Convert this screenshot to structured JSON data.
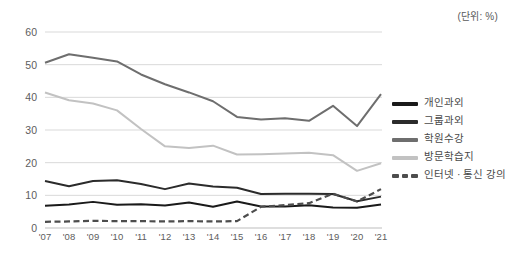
{
  "unit_note": "(단위: %)",
  "legend": {
    "position": "right",
    "items": [
      {
        "label": "개인과외",
        "color": "#1a1a1a",
        "style": "solid"
      },
      {
        "label": "그룹과외",
        "color": "#2b2b2b",
        "style": "solid"
      },
      {
        "label": "학원수강",
        "color": "#6e6e6e",
        "style": "solid"
      },
      {
        "label": "방문학습지",
        "color": "#c2c2c2",
        "style": "solid"
      },
      {
        "label": "인터넷 · 통신 강의",
        "color": "#4d4d4d",
        "style": "dashed"
      }
    ]
  },
  "chart_data": {
    "type": "line",
    "title": "",
    "subtitle": "",
    "xlabel": "",
    "ylabel": "",
    "unit": "%",
    "grid": true,
    "legend_position": "right",
    "ylim": [
      0,
      60
    ],
    "yticks": [
      0,
      10,
      20,
      30,
      40,
      50,
      60
    ],
    "categories": [
      "'07",
      "'08",
      "'09",
      "'10",
      "'11",
      "'12",
      "'13",
      "'14",
      "'15",
      "'16",
      "'17",
      "'18",
      "'19",
      "'20",
      "'21"
    ],
    "series": [
      {
        "name": "개인과외",
        "color": "#1a1a1a",
        "style": "solid",
        "values": [
          6.8,
          7.2,
          8.0,
          7.1,
          7.3,
          6.9,
          7.8,
          6.5,
          8.1,
          6.6,
          6.6,
          7.0,
          6.3,
          6.2,
          7.2
        ]
      },
      {
        "name": "그룹과외",
        "color": "#2b2b2b",
        "style": "solid",
        "values": [
          14.4,
          12.8,
          14.4,
          14.6,
          13.5,
          11.9,
          13.6,
          12.7,
          12.3,
          10.4,
          10.5,
          10.5,
          10.4,
          8.2,
          9.6
        ]
      },
      {
        "name": "학원수강",
        "color": "#6e6e6e",
        "style": "solid",
        "values": [
          50.6,
          53.2,
          52.1,
          51.0,
          47.0,
          44.0,
          41.5,
          38.8,
          34.0,
          33.2,
          33.6,
          32.8,
          37.4,
          31.2,
          41.0
        ]
      },
      {
        "name": "방문학습지",
        "color": "#c2c2c2",
        "style": "solid",
        "values": [
          41.5,
          39.1,
          38.1,
          36.0,
          30.3,
          25.0,
          24.5,
          25.2,
          22.5,
          22.6,
          22.8,
          23.0,
          22.3,
          17.5,
          19.8
        ]
      },
      {
        "name": "인터넷 · 통신 강의",
        "color": "#4d4d4d",
        "style": "dashed",
        "values": [
          1.9,
          2.0,
          2.2,
          2.1,
          2.1,
          2.0,
          2.1,
          2.0,
          2.1,
          6.5,
          7.0,
          7.6,
          10.5,
          8.1,
          11.9
        ]
      }
    ]
  }
}
